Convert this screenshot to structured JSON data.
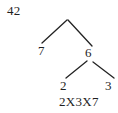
{
  "diagram": {
    "type": "factor-tree",
    "title_number": "42",
    "nodes": [
      {
        "id": "root",
        "label": "42",
        "x": 7,
        "y": 4
      },
      {
        "id": "left-factor",
        "label": "7",
        "x": 38,
        "y": 44
      },
      {
        "id": "right-factor",
        "label": "6",
        "x": 85,
        "y": 46
      },
      {
        "id": "leaf-two",
        "label": "2",
        "x": 60,
        "y": 79
      },
      {
        "id": "leaf-three",
        "label": "3",
        "x": 105,
        "y": 79
      }
    ],
    "branches": [
      {
        "id": "root-to-7",
        "x1": 67,
        "y1": 20,
        "x2": 42,
        "y2": 43
      },
      {
        "id": "root-to-6",
        "x1": 68,
        "y1": 20,
        "x2": 92,
        "y2": 46
      },
      {
        "id": "six-to-2",
        "x1": 87,
        "y1": 61,
        "x2": 66,
        "y2": 78
      },
      {
        "id": "six-to-3",
        "x1": 93,
        "y1": 62,
        "x2": 114,
        "y2": 78
      }
    ],
    "result_expression": "2X3X7",
    "colors": {
      "background": "#ffffff",
      "ink": "#1f1f1f",
      "line": "#232323"
    }
  }
}
